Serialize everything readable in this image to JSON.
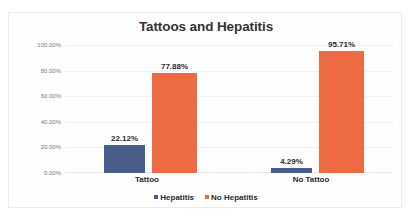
{
  "chart_data": {
    "type": "bar",
    "title": "Tattoos and Hepatitis",
    "xlabel": "",
    "ylabel": "",
    "categories": [
      "Tattoo",
      "No Tattoo"
    ],
    "series": [
      {
        "name": "Hepatitis",
        "color": "#4a5e8c",
        "values": [
          22.12,
          95.71
        ],
        "labels": [
          "22.12%",
          "4.29%"
        ],
        "values_actual": [
          22.12,
          4.29
        ]
      },
      {
        "name": "No Hepatitis",
        "color": "#ed6b43",
        "values": [
          77.88,
          95.71
        ],
        "labels": [
          "77.88%",
          "95.71%"
        ]
      }
    ],
    "ylim": [
      0,
      100
    ],
    "yticks": [
      100,
      80,
      60,
      40,
      20,
      0
    ],
    "ytick_labels": [
      "100.00%",
      "80.00%",
      "60.00%",
      "40.00%",
      "20.00%",
      "0.00%"
    ],
    "grid": true,
    "legend_position": "bottom",
    "bars": [
      {
        "group": "Tattoo",
        "series": "Hepatitis",
        "value": 22.12,
        "label": "22.12%",
        "color": "#4a5e8c"
      },
      {
        "group": "Tattoo",
        "series": "No Hepatitis",
        "value": 77.88,
        "label": "77.88%",
        "color": "#ed6b43"
      },
      {
        "group": "No Tattoo",
        "series": "Hepatitis",
        "value": 4.29,
        "label": "4.29%",
        "color": "#4a5e8c"
      },
      {
        "group": "No Tattoo",
        "series": "No Hepatitis",
        "value": 95.71,
        "label": "95.71%",
        "color": "#ed6b43"
      }
    ]
  },
  "legend": {
    "items": [
      {
        "label": "Hepatitis",
        "color": "#4a5e8c"
      },
      {
        "label": "No Hepatitis",
        "color": "#ed6b43"
      }
    ]
  }
}
